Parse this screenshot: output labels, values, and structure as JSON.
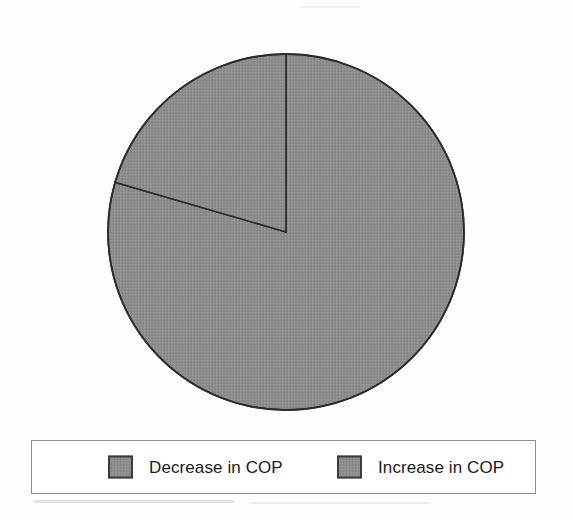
{
  "figure": {
    "background_color": "#ffffff",
    "slice_fill_color": "#8d8d8d",
    "outline_color": "#2b2b2b",
    "legend_border_color": "#8f8f8f",
    "legend_background_color": "#ffffff"
  },
  "legend": {
    "position": "bottom",
    "items": [
      {
        "label": "Decrease in COP",
        "color": "#8d8d8d"
      },
      {
        "label": "Increase in COP",
        "color": "#8d8d8d"
      }
    ]
  },
  "chart_data": {
    "type": "pie",
    "title": "",
    "subtitle": "",
    "xlabel": "",
    "ylabel": "",
    "grid": false,
    "legend_position": "bottom",
    "start_angle_deg": 0,
    "direction": "clockwise",
    "labels": [
      "Decrease in COP",
      "Increase in COP"
    ],
    "values": [
      79.5,
      20.5
    ],
    "units": "percent",
    "slices": [
      {
        "label": "Decrease in COP",
        "value": 79.5,
        "percent": "79.5%",
        "sweep_deg": 286,
        "color": "#8d8d8d"
      },
      {
        "label": "Increase in COP",
        "value": 20.5,
        "percent": "20.5%",
        "sweep_deg": 74,
        "color": "#8d8d8d"
      }
    ]
  }
}
